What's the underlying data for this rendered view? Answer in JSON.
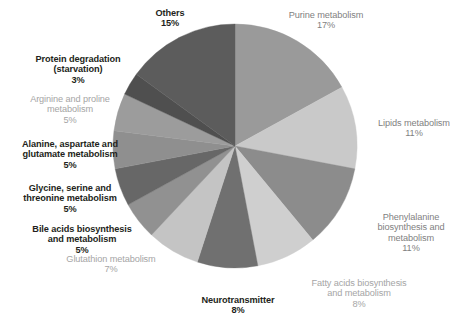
{
  "chart_data": {
    "type": "pie",
    "title": "",
    "subtitle": "",
    "xlabel": "",
    "ylabel": "",
    "legend_position": "none",
    "grid": false,
    "labels_show_percent": true,
    "categories": [
      "Purine metabolism",
      "Lipids metabolism",
      "Phenylalanine biosynthesis and metabolism",
      "Fatty acids biosynthesis and metabolism",
      "Neurotransmitter",
      "Glutathion metabolism",
      "Bile acids biosynthesis and metabolism",
      "Glycine, serine and threonine metabolism",
      "Alanine, aspartate and glutamate metabolism",
      "Arginine and proline metabolism",
      "Protein degradation (starvation)",
      "Others"
    ],
    "values": [
      17,
      11,
      11,
      8,
      8,
      7,
      5,
      5,
      5,
      5,
      3,
      15
    ],
    "units": "%",
    "slices": [
      {
        "name": "Purine metabolism",
        "label_lines": "Purine metabolism",
        "percent": "17%",
        "value": 17,
        "color": "#9a9a9a",
        "label_style": "mid"
      },
      {
        "name": "Lipids metabolism",
        "label_lines": "Lipids metabolism",
        "percent": "11%",
        "value": 11,
        "color": "#c9c9c9",
        "label_style": "mid"
      },
      {
        "name": "Phenylalanine biosynthesis and metabolism",
        "label_lines": "Phenylalanine\nbiosynthesis and\nmetabolism",
        "percent": "11%",
        "value": 11,
        "color": "#8c8c8c",
        "label_style": "mid"
      },
      {
        "name": "Fatty acids biosynthesis and metabolism",
        "label_lines": "Fatty acids biosynthesis\nand metabolism",
        "percent": "8%",
        "value": 8,
        "color": "#cfcfcf",
        "label_style": "light"
      },
      {
        "name": "Neurotransmitter",
        "label_lines": "Neurotransmitter",
        "percent": "8%",
        "value": 8,
        "color": "#707070",
        "label_style": "dark"
      },
      {
        "name": "Glutathion metabolism",
        "label_lines": "Glutathion metabolism",
        "percent": "7%",
        "value": 7,
        "color": "#c4c4c4",
        "label_style": "light"
      },
      {
        "name": "Bile acids biosynthesis and metabolism",
        "label_lines": "Bile acids biosynthesis\nand metabolism",
        "percent": "5%",
        "value": 5,
        "color": "#919191",
        "label_style": "dark"
      },
      {
        "name": "Glycine, serine and threonine metabolism",
        "label_lines": "Glycine, serine and\nthreonine metabolism",
        "percent": "5%",
        "value": 5,
        "color": "#676767",
        "label_style": "dark"
      },
      {
        "name": "Alanine, aspartate and glutamate metabolism",
        "label_lines": "Alanine, aspartate and\nglutamate metabolism",
        "percent": "5%",
        "value": 5,
        "color": "#8f8f8f",
        "label_style": "dark"
      },
      {
        "name": "Arginine and proline metabolism",
        "label_lines": "Arginine and proline\nmetabolism",
        "percent": "5%",
        "value": 5,
        "color": "#9c9c9c",
        "label_style": "light"
      },
      {
        "name": "Protein degradation (starvation)",
        "label_lines": "Protein degradation\n(starvation)",
        "percent": "3%",
        "value": 3,
        "color": "#4f4f4f",
        "label_style": "dark"
      },
      {
        "name": "Others",
        "label_lines": "Others",
        "percent": "15%",
        "value": 15,
        "color": "#5c5c5c",
        "label_style": "dark"
      }
    ],
    "geometry": {
      "center_x": 235,
      "center_y": 146,
      "radius": 122,
      "start_angle_deg": 0,
      "direction": "clockwise"
    },
    "label_positions": [
      {
        "name": "Purine metabolism",
        "left": 268,
        "top": 10,
        "width": 116
      },
      {
        "name": "Lipids metabolism",
        "left": 366,
        "top": 118,
        "width": 96
      },
      {
        "name": "Phenylalanine biosynthesis and metabolism",
        "left": 362,
        "top": 212,
        "width": 98
      },
      {
        "name": "Fatty acids biosynthesis and metabolism",
        "left": 294,
        "top": 278,
        "width": 130
      },
      {
        "name": "Neurotransmitter",
        "left": 183,
        "top": 295,
        "width": 110
      },
      {
        "name": "Glutathion metabolism",
        "left": 48,
        "top": 254,
        "width": 126
      },
      {
        "name": "Bile acids biosynthesis and metabolism",
        "left": 18,
        "top": 224,
        "width": 128
      },
      {
        "name": "Glycine, serine and threonine metabolism",
        "left": 6,
        "top": 183,
        "width": 128
      },
      {
        "name": "Alanine, aspartate and glutamate metabolism",
        "left": 0,
        "top": 139,
        "width": 140
      },
      {
        "name": "Arginine and proline metabolism",
        "left": 8,
        "top": 94,
        "width": 124
      },
      {
        "name": "Protein degradation (starvation)",
        "left": 14,
        "top": 54,
        "width": 128
      },
      {
        "name": "Others",
        "left": 122,
        "top": 8,
        "width": 96
      }
    ]
  }
}
